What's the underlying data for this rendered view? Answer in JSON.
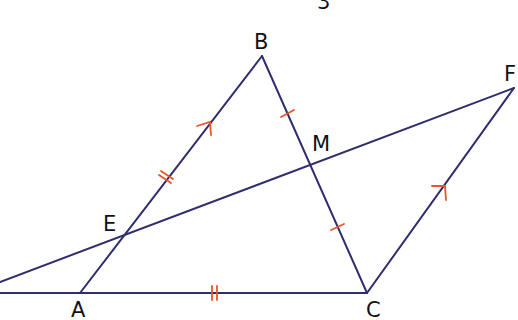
{
  "figure": {
    "top_label": "3",
    "points": {
      "A": {
        "label": "A",
        "x": 80,
        "y": 293
      },
      "B": {
        "label": "B",
        "x": 262,
        "y": 56
      },
      "C": {
        "label": "C",
        "x": 367,
        "y": 293
      },
      "E": {
        "label": "E",
        "x": 124,
        "y": 236
      },
      "M": {
        "label": "M",
        "x": 311,
        "y": 166
      },
      "F": {
        "label": "F",
        "x": 514,
        "y": 88
      }
    },
    "colors": {
      "line": "#2e2e6e",
      "mark": "#e8542a",
      "text": "#111111"
    },
    "segments": [
      "AB",
      "BC",
      "CA",
      "EF (extended left)",
      "CF"
    ],
    "markings": {
      "parallel_arrows": [
        "AB",
        "CF"
      ],
      "double_ticks": [
        "AE",
        "AC"
      ],
      "single_ticks": [
        "BM",
        "MC"
      ]
    }
  }
}
